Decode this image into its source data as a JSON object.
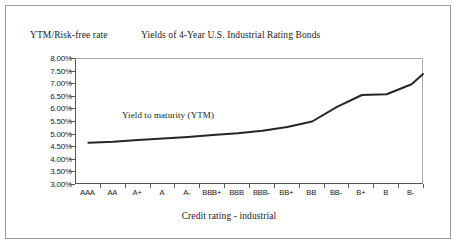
{
  "figure": {
    "title": "Yields of 4-Year U.S. Industrial Rating Bonds",
    "y_axis_title": "YTM/Risk-free rate",
    "x_axis_title": "Credit rating - industrial",
    "annotation": "Yield to maturity (YTM)",
    "frame_color": "#9a9a9a",
    "line_color": "#262626",
    "axis_color": "#555555",
    "background": "#ffffff"
  },
  "chart_data": {
    "type": "line",
    "title": "Yields of 4-Year U.S. Industrial Rating Bonds",
    "xlabel": "Credit rating - industrial",
    "ylabel": "YTM/Risk-free rate",
    "categories": [
      "AAA",
      "AA",
      "A+",
      "A",
      "A-",
      "BBB+",
      "BBB",
      "BBB-",
      "BB+",
      "BB",
      "BB-",
      "B+",
      "B",
      "B-"
    ],
    "series": [
      {
        "name": "Yield to maturity (YTM)",
        "values": [
          4.68,
          4.72,
          4.78,
          4.84,
          4.91,
          4.98,
          5.05,
          5.15,
          5.3,
          5.52,
          6.1,
          6.57,
          6.6,
          7.0
        ]
      }
    ],
    "ylim": [
      3.0,
      8.0
    ],
    "ytick_values": [
      8.0,
      7.5,
      7.0,
      6.5,
      6.0,
      5.5,
      5.0,
      4.5,
      4.0,
      3.5,
      3.0
    ],
    "ytick_labels": [
      "8.00%",
      "7.50%",
      "7.00%",
      "6.50%",
      "6.00%",
      "5.50%",
      "5.00%",
      "4.50%",
      "4.00%",
      "3.50%",
      "3.00%"
    ],
    "grid": false,
    "legend": "none",
    "annotations": [
      {
        "text": "Yield to maturity (YTM)",
        "x_category": "A-",
        "y_value": 5.85
      }
    ],
    "line_end_value": 7.4
  }
}
